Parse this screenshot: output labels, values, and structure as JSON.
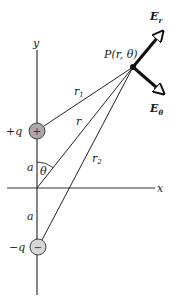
{
  "diagram": {
    "axes": {
      "x_label": "x",
      "y_label": "y"
    },
    "point": {
      "label": "P(r, θ)"
    },
    "vectors": [
      {
        "label": "E",
        "subscript": "r"
      },
      {
        "label": "E",
        "subscript": "θ"
      }
    ],
    "charges": [
      {
        "label": "+q",
        "sign": "+",
        "fill": "#a9a9a9"
      },
      {
        "label": "−q",
        "sign": "−",
        "fill": "#d6d6d6"
      }
    ],
    "distances": {
      "r1": {
        "label": "r",
        "subscript": "1"
      },
      "r": {
        "label": "r"
      },
      "r2": {
        "label": "r",
        "subscript": "2"
      },
      "a_upper": "a",
      "a_lower": "a"
    },
    "angle": {
      "label": "θ"
    }
  }
}
